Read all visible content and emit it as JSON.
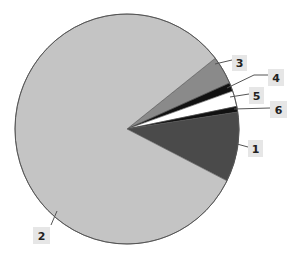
{
  "chart_data": {
    "type": "pie",
    "title": "",
    "start_angle_deg": -38,
    "direction": "clockwise",
    "geometry": {
      "cx": 127,
      "cy": 129,
      "rx": 112,
      "ry": 115
    },
    "slices": [
      {
        "label": "3",
        "value": 4.0,
        "color": "#8a8a8a"
      },
      {
        "label": "4",
        "value": 1.2,
        "color": "#111111"
      },
      {
        "label": "5",
        "value": 2.2,
        "color": "#ffffff"
      },
      {
        "label": "6",
        "value": 0.8,
        "color": "#111111"
      },
      {
        "label": "1",
        "value": 9.8,
        "color": "#4a4a4a"
      },
      {
        "label": "2",
        "value": 82.0,
        "color": "#c4c4c4"
      }
    ],
    "labels": [
      {
        "text": "3",
        "box": [
          232,
          55,
          15,
          16
        ],
        "leader": [
          [
            215,
            64
          ],
          [
            232,
            60
          ]
        ]
      },
      {
        "text": "4",
        "box": [
          268,
          69,
          16,
          17
        ],
        "leader": [
          [
            227,
            88
          ],
          [
            254,
            75
          ],
          [
            268,
            75
          ]
        ]
      },
      {
        "text": "5",
        "box": [
          249,
          87,
          15,
          17
        ],
        "leader": [
          [
            230,
            97
          ],
          [
            249,
            94
          ]
        ]
      },
      {
        "text": "6",
        "box": [
          270,
          101,
          17,
          17
        ],
        "leader": [
          [
            234,
            109
          ],
          [
            270,
            108
          ]
        ]
      },
      {
        "text": "1",
        "box": [
          248,
          140,
          15,
          17
        ],
        "leader": [
          [
            237,
            144
          ],
          [
            248,
            147
          ]
        ]
      },
      {
        "text": "2",
        "box": [
          33,
          227,
          17,
          17
        ],
        "leader": [
          [
            57,
            211
          ],
          [
            51,
            225
          ]
        ]
      }
    ],
    "legend": null,
    "grid": false
  }
}
